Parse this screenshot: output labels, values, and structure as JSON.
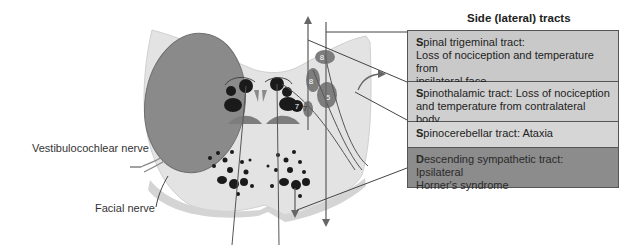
{
  "panel": {
    "title": "Side (lateral) tracts"
  },
  "tracts": [
    {
      "initial": "S",
      "rest": "pinal trigeminal tract:",
      "line2": "Loss of nociception and temperature from",
      "line3": "ipsilateral face"
    },
    {
      "initial": "S",
      "rest": "pinothalamic tract: Loss of nociception",
      "line2": "and temperature from contralateral body"
    },
    {
      "initial": "S",
      "rest": "pinocerebellar tract: Ataxia"
    },
    {
      "initial": "D",
      "rest": "escending sympathetic tract: Ipsilateral",
      "line2": "Horner's syndrome"
    }
  ],
  "labels": {
    "vestibulocochlear": "Vestibulocochlear nerve",
    "facial": "Facial nerve"
  },
  "nuclei_numbers": {
    "n8_upper": "8",
    "n8_lower": "8",
    "n7_right": "7",
    "n7_small": "7",
    "n5": "5"
  },
  "colors": {
    "brainstem": "#e3e3e3",
    "brainstem_edge": "#cfcfcf",
    "mass": "#8a8a8a",
    "nucleus_dark": "#1a1a1a",
    "nucleus_gray": "#7d7d7d",
    "box_light": "#c9c9c9",
    "box_dark": "#8c8c8c"
  }
}
